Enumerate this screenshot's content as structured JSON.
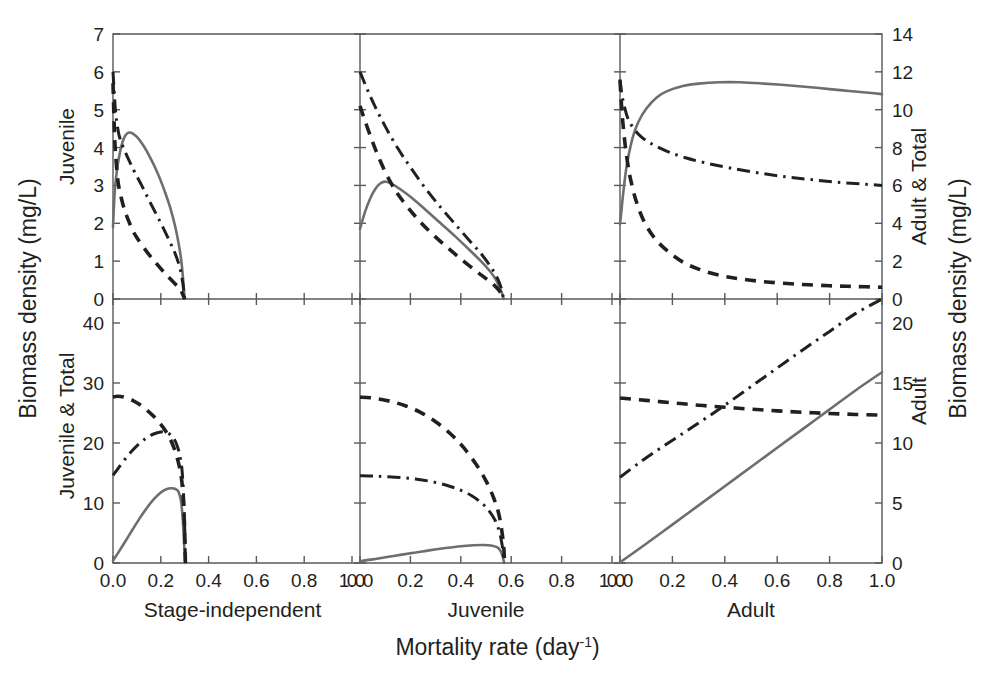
{
  "figure": {
    "left_axis_title": "Biomass density (mg/L)",
    "right_axis_title": "Biomass density (mg/L)",
    "x_axis_title_main": "Mortality rate (day",
    "x_axis_title_sup": "-1",
    "x_axis_title_tail": ")",
    "row_top_left_label": "Juvenile",
    "row_top_right_label": "Adult & Total",
    "row_bottom_left_label": "Juvenile & Total",
    "row_bottom_right_label": "Adult",
    "column_labels": [
      "Stage-independent",
      "Juvenile",
      "Adult"
    ],
    "colors": {
      "solid": "#6d6e71",
      "dashed": "#231f20",
      "dashdot": "#231f20",
      "axis": "#58595b",
      "text": "#231f20",
      "background": "#ffffff"
    }
  },
  "chart_data": {
    "type": "line",
    "title": "",
    "xlabel": "Mortality rate (day-1)",
    "ylabel": "Biomass density (mg/L)",
    "layout": {
      "rows": 2,
      "cols": 3,
      "grid": false,
      "legend": "none",
      "shared_x": true
    },
    "x_ticks": [
      0.0,
      0.2,
      0.4,
      0.6,
      0.8,
      1.0
    ],
    "x_tick_labels": [
      "0.0",
      "0.2",
      "0.4",
      "0.6",
      "0.8",
      "1.0"
    ],
    "xlim": [
      0.0,
      1.0
    ],
    "axes": {
      "top_left": {
        "label": "Juvenile",
        "ylim": [
          0,
          7
        ],
        "ticks": [
          0,
          1,
          2,
          3,
          4,
          5,
          6,
          7
        ],
        "tick_labels": [
          "0",
          "1",
          "2",
          "3",
          "4",
          "5",
          "6",
          "7"
        ]
      },
      "top_right": {
        "label": "Adult & Total",
        "ylim": [
          0,
          14
        ],
        "ticks": [
          0,
          2,
          4,
          6,
          8,
          10,
          12,
          14
        ],
        "tick_labels": [
          "0",
          "2",
          "4",
          "6",
          "8",
          "10",
          "12",
          "14"
        ]
      },
      "bottom_left": {
        "label": "Juvenile & Total",
        "ylim": [
          0,
          44
        ],
        "ticks": [
          0,
          10,
          20,
          30,
          40
        ],
        "tick_labels": [
          "0",
          "10",
          "20",
          "30",
          "40"
        ]
      },
      "bottom_right": {
        "label": "Adult",
        "ylim": [
          0,
          22
        ],
        "ticks": [
          0,
          5,
          10,
          15,
          20
        ],
        "tick_labels": [
          "0",
          "5",
          "10",
          "15",
          "20"
        ]
      }
    },
    "panels": [
      {
        "name": "top-left",
        "row": 0,
        "col": 0,
        "column_label": "Stage-independent",
        "y_axis": "top_left",
        "series": [
          {
            "name": "solid",
            "style": "solid",
            "x": [
              0.0,
              0.005,
              0.01,
              0.02,
              0.03,
              0.04,
              0.05,
              0.06,
              0.07,
              0.08,
              0.1,
              0.12,
              0.14,
              0.16,
              0.18,
              0.2,
              0.22,
              0.24,
              0.26,
              0.275,
              0.285,
              0.292,
              0.296,
              0.3
            ],
            "y": [
              1.9,
              2.6,
              3.05,
              3.55,
              3.9,
              4.15,
              4.3,
              4.38,
              4.4,
              4.38,
              4.28,
              4.12,
              3.92,
              3.68,
              3.42,
              3.12,
              2.78,
              2.4,
              1.92,
              1.45,
              1.05,
              0.62,
              0.3,
              0.0
            ]
          },
          {
            "name": "dashed",
            "style": "dashed",
            "x": [
              0.0,
              0.005,
              0.01,
              0.02,
              0.03,
              0.05,
              0.08,
              0.1,
              0.14,
              0.18,
              0.22,
              0.26,
              0.28,
              0.292,
              0.3
            ],
            "y": [
              5.7,
              4.6,
              3.9,
              3.15,
              2.8,
              2.32,
              1.85,
              1.62,
              1.26,
              0.95,
              0.66,
              0.4,
              0.28,
              0.12,
              0.0
            ]
          },
          {
            "name": "dashdot",
            "style": "dashdot",
            "x": [
              0.0,
              0.01,
              0.02,
              0.03,
              0.05,
              0.07,
              0.09,
              0.12,
              0.15,
              0.18,
              0.21,
              0.24,
              0.26,
              0.28,
              0.292,
              0.3
            ],
            "y": [
              6.0,
              5.0,
              4.5,
              4.22,
              3.9,
              3.62,
              3.36,
              3.0,
              2.62,
              2.25,
              1.88,
              1.48,
              1.2,
              0.82,
              0.42,
              0.0
            ]
          }
        ]
      },
      {
        "name": "top-center",
        "row": 0,
        "col": 1,
        "column_label": "Juvenile",
        "y_axis": "top_left",
        "series": [
          {
            "name": "solid",
            "style": "solid",
            "x": [
              0.0,
              0.02,
              0.04,
              0.06,
              0.08,
              0.1,
              0.12,
              0.16,
              0.2,
              0.26,
              0.32,
              0.38,
              0.44,
              0.48,
              0.51,
              0.535,
              0.55,
              0.562,
              0.57
            ],
            "y": [
              1.85,
              2.3,
              2.65,
              2.9,
              3.05,
              3.1,
              3.06,
              2.9,
              2.7,
              2.36,
              2.0,
              1.64,
              1.26,
              1.0,
              0.78,
              0.56,
              0.36,
              0.18,
              0.0
            ]
          },
          {
            "name": "dashed",
            "style": "dashed",
            "x": [
              0.0,
              0.02,
              0.05,
              0.08,
              0.12,
              0.16,
              0.22,
              0.28,
              0.34,
              0.4,
              0.46,
              0.5,
              0.53,
              0.55,
              0.562,
              0.57
            ],
            "y": [
              5.1,
              4.7,
              4.15,
              3.65,
              3.1,
              2.68,
              2.18,
              1.76,
              1.4,
              1.06,
              0.74,
              0.54,
              0.38,
              0.24,
              0.12,
              0.0
            ]
          },
          {
            "name": "dashdot",
            "style": "dashdot",
            "x": [
              0.0,
              0.03,
              0.06,
              0.1,
              0.15,
              0.2,
              0.26,
              0.32,
              0.38,
              0.44,
              0.48,
              0.52,
              0.545,
              0.56,
              0.57
            ],
            "y": [
              6.0,
              5.52,
              5.08,
              4.56,
              3.98,
              3.48,
              2.92,
              2.42,
              1.96,
              1.5,
              1.2,
              0.84,
              0.55,
              0.3,
              0.0
            ]
          }
        ]
      },
      {
        "name": "top-right",
        "row": 0,
        "col": 2,
        "column_label": "Adult",
        "y_axis": "top_right",
        "series": [
          {
            "name": "solid",
            "style": "solid",
            "x": [
              0.0,
              0.005,
              0.01,
              0.02,
              0.03,
              0.05,
              0.07,
              0.1,
              0.14,
              0.18,
              0.24,
              0.3,
              0.38,
              0.46,
              0.55,
              0.65,
              0.75,
              0.85,
              0.95,
              1.0
            ],
            "y": [
              3.95,
              4.6,
              5.3,
              6.5,
              7.4,
              8.6,
              9.35,
              10.05,
              10.65,
              10.98,
              11.25,
              11.38,
              11.45,
              11.45,
              11.38,
              11.28,
              11.16,
              11.02,
              10.9,
              10.82
            ]
          },
          {
            "name": "dashed",
            "style": "dashed",
            "x": [
              0.0,
              0.005,
              0.01,
              0.02,
              0.03,
              0.04,
              0.06,
              0.09,
              0.13,
              0.18,
              0.24,
              0.3,
              0.38,
              0.46,
              0.56,
              0.68,
              0.8,
              0.9,
              1.0
            ],
            "y": [
              11.55,
              10.4,
              9.45,
              8.1,
              7.1,
              6.35,
              5.25,
              4.15,
              3.25,
              2.55,
              1.95,
              1.58,
              1.25,
              1.06,
              0.9,
              0.78,
              0.7,
              0.66,
              0.62
            ]
          },
          {
            "name": "dashdot",
            "style": "dashdot",
            "x": [
              0.0,
              0.005,
              0.012,
              0.02,
              0.03,
              0.05,
              0.08,
              0.12,
              0.18,
              0.25,
              0.33,
              0.42,
              0.52,
              0.62,
              0.72,
              0.82,
              0.92,
              1.0
            ],
            "y": [
              11.6,
              11.0,
              10.45,
              10.0,
              9.55,
              9.05,
              8.58,
              8.2,
              7.8,
              7.46,
              7.18,
              6.92,
              6.68,
              6.48,
              6.32,
              6.18,
              6.08,
              6.0
            ]
          }
        ]
      },
      {
        "name": "bottom-left",
        "row": 1,
        "col": 0,
        "column_label": "Stage-independent",
        "y_axis": "bottom_left",
        "series": [
          {
            "name": "solid",
            "style": "solid",
            "x": [
              0.0,
              0.02,
              0.05,
              0.08,
              0.11,
              0.14,
              0.17,
              0.2,
              0.22,
              0.24,
              0.255,
              0.265,
              0.275,
              0.285,
              0.292,
              0.297,
              0.302
            ],
            "y": [
              0.4,
              1.6,
              3.5,
              5.45,
              7.35,
              9.1,
              10.6,
              11.75,
              12.25,
              12.45,
              12.4,
              12.25,
              11.8,
              10.2,
              7.2,
              3.5,
              0.0
            ]
          },
          {
            "name": "dashed",
            "style": "dashed",
            "x": [
              0.0,
              0.02,
              0.05,
              0.08,
              0.11,
              0.14,
              0.17,
              0.2,
              0.22,
              0.24,
              0.255,
              0.268,
              0.278,
              0.288,
              0.295,
              0.3,
              0.303
            ],
            "y": [
              27.65,
              27.8,
              27.6,
              27.15,
              26.45,
              25.55,
              24.45,
              23.1,
              22.0,
              20.6,
              19.2,
              17.6,
              16.0,
              13.6,
              10.0,
              5.2,
              0.0
            ]
          },
          {
            "name": "dashdot",
            "style": "dashdot",
            "x": [
              0.0,
              0.02,
              0.05,
              0.08,
              0.11,
              0.14,
              0.17,
              0.2,
              0.22,
              0.24,
              0.255,
              0.268,
              0.278,
              0.288,
              0.295,
              0.3,
              0.303
            ],
            "y": [
              14.6,
              15.7,
              17.3,
              18.7,
              19.9,
              20.85,
              21.5,
              21.85,
              21.8,
              21.4,
              20.7,
              19.6,
              18.2,
              15.8,
              11.6,
              6.0,
              0.0
            ]
          }
        ]
      },
      {
        "name": "bottom-center",
        "row": 1,
        "col": 1,
        "column_label": "Juvenile",
        "y_axis": "bottom_left",
        "series": [
          {
            "name": "solid",
            "style": "solid",
            "x": [
              0.0,
              0.05,
              0.1,
              0.16,
              0.22,
              0.28,
              0.34,
              0.4,
              0.45,
              0.49,
              0.52,
              0.545,
              0.558,
              0.566,
              0.572
            ],
            "y": [
              0.3,
              0.6,
              0.95,
              1.35,
              1.75,
              2.15,
              2.5,
              2.8,
              2.95,
              3.0,
              2.92,
              2.6,
              2.0,
              1.1,
              0.0
            ]
          },
          {
            "name": "dashed",
            "style": "dashed",
            "x": [
              0.0,
              0.04,
              0.08,
              0.13,
              0.18,
              0.24,
              0.3,
              0.36,
              0.41,
              0.46,
              0.5,
              0.53,
              0.55,
              0.562,
              0.57,
              0.574
            ],
            "y": [
              27.65,
              27.55,
              27.3,
              26.85,
              26.2,
              25.1,
              23.55,
              21.5,
              19.3,
              16.5,
              13.7,
              10.9,
              8.3,
              5.6,
              2.8,
              0.0
            ]
          },
          {
            "name": "dashdot",
            "style": "dashdot",
            "x": [
              0.0,
              0.05,
              0.1,
              0.16,
              0.22,
              0.28,
              0.34,
              0.39,
              0.44,
              0.48,
              0.51,
              0.535,
              0.552,
              0.564,
              0.572
            ],
            "y": [
              14.55,
              14.5,
              14.4,
              14.25,
              14.0,
              13.6,
              13.0,
              12.3,
              11.3,
              10.1,
              8.8,
              7.2,
              5.4,
              3.0,
              0.0
            ]
          }
        ]
      },
      {
        "name": "bottom-right",
        "row": 1,
        "col": 2,
        "column_label": "Adult",
        "y_axis": "bottom_right",
        "series": [
          {
            "name": "solid",
            "style": "solid",
            "x": [
              0.0,
              0.1,
              0.2,
              0.3,
              0.4,
              0.5,
              0.6,
              0.7,
              0.8,
              0.9,
              1.0
            ],
            "y": [
              0.05,
              1.6,
              3.2,
              4.8,
              6.4,
              8.0,
              9.6,
              11.2,
              12.8,
              14.4,
              15.9
            ]
          },
          {
            "name": "dashed",
            "style": "dashed",
            "x": [
              0.0,
              0.1,
              0.2,
              0.3,
              0.4,
              0.5,
              0.6,
              0.7,
              0.8,
              0.9,
              1.0
            ],
            "y": [
              13.75,
              13.55,
              13.35,
              13.15,
              12.98,
              12.82,
              12.68,
              12.56,
              12.46,
              12.38,
              12.32
            ]
          },
          {
            "name": "dashdot",
            "style": "dashdot",
            "x": [
              0.0,
              0.08,
              0.16,
              0.24,
              0.32,
              0.4,
              0.5,
              0.6,
              0.7,
              0.8,
              0.9,
              1.0
            ],
            "y": [
              7.15,
              8.45,
              9.65,
              10.8,
              11.95,
              13.15,
              14.7,
              16.25,
              17.8,
              19.3,
              20.8,
              22.0
            ]
          }
        ]
      }
    ]
  }
}
